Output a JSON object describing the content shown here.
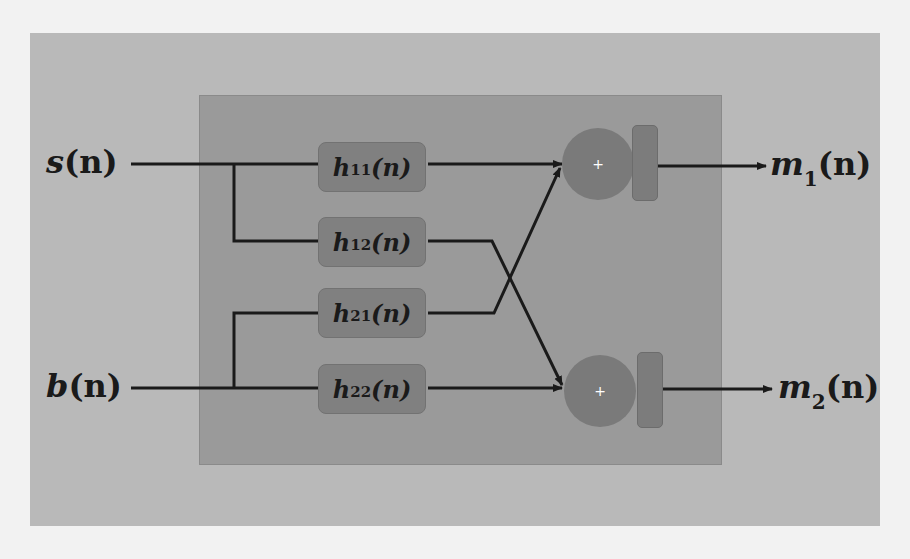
{
  "diagram": {
    "inputs": [
      {
        "id": "s",
        "label": "s",
        "arg": "(n)"
      },
      {
        "id": "b",
        "label": "b",
        "arg": "(n)"
      }
    ],
    "filters": [
      {
        "id": "h11",
        "label": "h",
        "sub": "11",
        "arg": "(n)"
      },
      {
        "id": "h12",
        "label": "h",
        "sub": "12",
        "arg": "(n)"
      },
      {
        "id": "h21",
        "label": "h",
        "sub": "21",
        "arg": "(n)"
      },
      {
        "id": "h22",
        "label": "h",
        "sub": "22",
        "arg": "(n)"
      }
    ],
    "adders": [
      {
        "id": "sum1",
        "symbol": "+"
      },
      {
        "id": "sum2",
        "symbol": "+"
      }
    ],
    "outputs": [
      {
        "id": "m1",
        "label": "m",
        "sub": "1",
        "arg": "(n)"
      },
      {
        "id": "m2",
        "label": "m",
        "sub": "2",
        "arg": "(n)"
      }
    ],
    "edges": [
      [
        "s",
        "h11"
      ],
      [
        "s",
        "h12"
      ],
      [
        "b",
        "h21"
      ],
      [
        "b",
        "h22"
      ],
      [
        "h11",
        "sum1"
      ],
      [
        "h21",
        "sum1"
      ],
      [
        "h12",
        "sum2"
      ],
      [
        "h22",
        "sum2"
      ],
      [
        "sum1",
        "m1"
      ],
      [
        "sum2",
        "m2"
      ]
    ],
    "colors": {
      "outer_bg": "#b9b9b9",
      "inner_bg": "#9a9a9a",
      "block": "#808080",
      "wire": "#1a1a1a"
    }
  }
}
